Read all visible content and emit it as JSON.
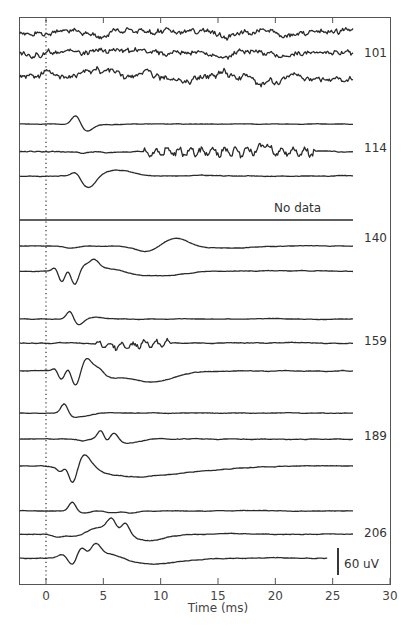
{
  "chart_data": {
    "type": "line",
    "title": "",
    "xlabel": "Time (ms)",
    "ylabel": "",
    "xlim": [
      -2.3,
      30
    ],
    "xticks": [
      0,
      5,
      10,
      15,
      20,
      25,
      30
    ],
    "grid": false,
    "onset_marker": {
      "x": 0,
      "style": "dotted"
    },
    "scale_bar": {
      "label": "60 uV",
      "value_uV": 60
    },
    "groups": [
      {
        "label": "101",
        "traces": [
          {
            "baseline_y": 33,
            "kind": "noise",
            "noise": 2.2,
            "seed": 11,
            "events": [
              [
                5.2,
                -4,
                0.6
              ]
            ]
          },
          {
            "baseline_y": 53,
            "kind": "noise",
            "noise": 2.2,
            "seed": 12,
            "events": []
          },
          {
            "baseline_y": 76,
            "kind": "noise",
            "noise": 2.6,
            "seed": 13,
            "events": []
          }
        ]
      },
      {
        "label": "114",
        "traces": [
          {
            "baseline_y": 124,
            "kind": "evoked",
            "noise": 0.3,
            "seed": 21,
            "events": [
              [
                2.6,
                9,
                0.35
              ],
              [
                3.6,
                -7,
                0.5
              ],
              [
                5.0,
                -1,
                1.0
              ]
            ]
          },
          {
            "baseline_y": 152,
            "kind": "evoked",
            "noise": 0.6,
            "seed": 22,
            "burst": [
              8.5,
              23.5,
              5
            ],
            "events": [
              [
                3.1,
                -1.5,
                0.4
              ],
              [
                19.0,
                7,
                0.4
              ]
            ]
          },
          {
            "baseline_y": 176,
            "kind": "evoked",
            "noise": 0.4,
            "seed": 23,
            "events": [
              [
                2.6,
                5,
                0.4
              ],
              [
                3.7,
                -12,
                0.6
              ],
              [
                6.3,
                6,
                1.2
              ]
            ]
          }
        ]
      },
      {
        "label": "No data",
        "traces": [
          {
            "baseline_y": 220,
            "kind": "flat",
            "noise": 0,
            "seed": 31,
            "events": []
          }
        ]
      },
      {
        "label": "140",
        "traces": [
          {
            "baseline_y": 246,
            "kind": "evoked",
            "noise": 0.3,
            "seed": 41,
            "events": [
              [
                2.2,
                -2,
                0.6
              ],
              [
                8.9,
                -6,
                1.0
              ],
              [
                11.3,
                9,
                1.1
              ],
              [
                15.0,
                -2,
                2.5
              ]
            ]
          },
          {
            "baseline_y": 271,
            "kind": "evoked",
            "noise": 0.4,
            "seed": 42,
            "events": [
              [
                0.8,
                4,
                0.25
              ],
              [
                1.4,
                -12,
                0.3
              ],
              [
                1.9,
                5,
                0.3
              ],
              [
                2.5,
                -15,
                0.35
              ],
              [
                3.3,
                5,
                0.4
              ],
              [
                4.2,
                9,
                0.4
              ],
              [
                5.5,
                4,
                1.5
              ],
              [
                8.0,
                -4,
                2.0
              ],
              [
                11.0,
                -3,
                1.6
              ]
            ]
          }
        ]
      },
      {
        "label": "159",
        "traces": [
          {
            "baseline_y": 319,
            "kind": "evoked",
            "noise": 0.3,
            "seed": 51,
            "events": [
              [
                2.1,
                9,
                0.3
              ],
              [
                2.8,
                -6,
                0.4
              ],
              [
                4.4,
                2,
                0.6
              ]
            ]
          },
          {
            "baseline_y": 343,
            "kind": "evoked",
            "noise": 0.5,
            "seed": 52,
            "burst": [
              4.3,
              11,
              4
            ],
            "events": [
              [
                6.5,
                -3,
                1.5
              ]
            ]
          },
          {
            "baseline_y": 371,
            "kind": "evoked",
            "noise": 0.4,
            "seed": 53,
            "events": [
              [
                0.8,
                4,
                0.25
              ],
              [
                1.4,
                -10,
                0.35
              ],
              [
                1.9,
                8,
                0.3
              ],
              [
                2.6,
                -17,
                0.4
              ],
              [
                3.5,
                14,
                0.5
              ],
              [
                4.6,
                5,
                0.4
              ],
              [
                5.6,
                -3,
                0.7
              ],
              [
                8.5,
                -8,
                2.2
              ],
              [
                10.0,
                -4,
                1.5
              ]
            ]
          }
        ]
      },
      {
        "label": "189",
        "traces": [
          {
            "baseline_y": 413,
            "kind": "evoked",
            "noise": 0.3,
            "seed": 61,
            "events": [
              [
                1.6,
                10,
                0.3
              ],
              [
                2.3,
                -3,
                0.4
              ],
              [
                3.3,
                -3,
                0.7
              ]
            ]
          },
          {
            "baseline_y": 439,
            "kind": "evoked",
            "noise": 0.4,
            "seed": 62,
            "events": [
              [
                3.3,
                -2,
                0.4
              ],
              [
                4.8,
                9,
                0.3
              ],
              [
                5.3,
                -5,
                0.3
              ],
              [
                5.9,
                8,
                0.4
              ],
              [
                6.5,
                -2,
                0.6
              ],
              [
                7.5,
                -3,
                1.0
              ]
            ]
          },
          {
            "baseline_y": 466,
            "kind": "evoked",
            "noise": 0.4,
            "seed": 63,
            "events": [
              [
                1.3,
                -5,
                0.3
              ],
              [
                1.8,
                6,
                0.3
              ],
              [
                2.3,
                -18,
                0.4
              ],
              [
                3.3,
                14,
                0.5
              ],
              [
                4.2,
                4,
                0.5
              ],
              [
                6.5,
                -8,
                2.5
              ],
              [
                10.0,
                -5,
                2.5
              ],
              [
                14.0,
                -3,
                3.0
              ]
            ]
          }
        ]
      },
      {
        "label": "206",
        "traces": [
          {
            "baseline_y": 511,
            "kind": "evoked",
            "noise": 0.3,
            "seed": 71,
            "events": [
              [
                2.3,
                9,
                0.3
              ],
              [
                3.3,
                -2,
                0.5
              ],
              [
                5.8,
                -2,
                0.5
              ],
              [
                7.4,
                -2,
                0.5
              ]
            ]
          },
          {
            "baseline_y": 534,
            "kind": "evoked",
            "noise": 0.4,
            "seed": 72,
            "events": [
              [
                1.0,
                -3,
                0.5
              ],
              [
                2.8,
                -3,
                0.8
              ],
              [
                4.5,
                7,
                0.9
              ],
              [
                5.8,
                14,
                0.45
              ],
              [
                6.3,
                -5,
                0.3
              ],
              [
                6.9,
                12,
                0.4
              ],
              [
                8.8,
                -5,
                1.2
              ],
              [
                10.0,
                -2,
                1.5
              ]
            ]
          },
          {
            "baseline_y": 558,
            "kind": "evoked",
            "noise": 0.4,
            "seed": 73,
            "end_t": 24.6,
            "events": [
              [
                1.4,
                4,
                0.4
              ],
              [
                2.3,
                -8,
                0.35
              ],
              [
                3.1,
                10,
                0.4
              ],
              [
                3.7,
                -2,
                0.3
              ],
              [
                4.3,
                13,
                0.45
              ],
              [
                5.7,
                5,
                1.0
              ],
              [
                8.5,
                -4,
                1.8
              ],
              [
                11.0,
                -3,
                2.0
              ]
            ]
          }
        ]
      }
    ]
  },
  "layout_hints": {
    "trace_start_t": -2.3,
    "trace_end_t": 26.8
  }
}
